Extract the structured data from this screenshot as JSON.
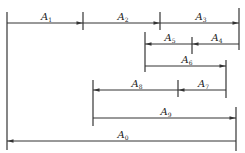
{
  "diagram": {
    "type": "dimension-chain",
    "colors": {
      "line": "#333333",
      "background": "#ffffff",
      "text": "#222222"
    },
    "verticals": [
      {
        "id": "left-datum",
        "x": 7,
        "y1": 12,
        "y2": 150
      },
      {
        "id": "tick-1-2",
        "x": 83,
        "y1": 12,
        "y2": 30
      },
      {
        "id": "tick-2-3",
        "x": 160,
        "y1": 12,
        "y2": 30
      },
      {
        "id": "right-A3",
        "x": 239,
        "y1": 8,
        "y2": 50
      },
      {
        "id": "left-A5",
        "x": 145,
        "y1": 32,
        "y2": 72
      },
      {
        "id": "tick-5-4",
        "x": 192,
        "y1": 37,
        "y2": 54
      },
      {
        "id": "right-A6",
        "x": 226,
        "y1": 60,
        "y2": 98
      },
      {
        "id": "left-A8",
        "x": 93,
        "y1": 80,
        "y2": 126
      },
      {
        "id": "tick-8-7",
        "x": 178,
        "y1": 80,
        "y2": 97
      },
      {
        "id": "right-A9",
        "x": 236,
        "y1": 107,
        "y2": 151
      }
    ],
    "dimensions": [
      {
        "label": "A",
        "sub": "1",
        "from": 7,
        "to": 83,
        "y": 23,
        "arrow": "right"
      },
      {
        "label": "A",
        "sub": "2",
        "from": 83,
        "to": 160,
        "y": 23,
        "arrow": "right"
      },
      {
        "label": "A",
        "sub": "3",
        "from": 160,
        "to": 239,
        "y": 23,
        "arrow": "right"
      },
      {
        "label": "A",
        "sub": "5",
        "from": 145,
        "to": 192,
        "y": 44,
        "arrow": "left"
      },
      {
        "label": "A",
        "sub": "4",
        "from": 192,
        "to": 239,
        "y": 44,
        "arrow": "left"
      },
      {
        "label": "A",
        "sub": "6",
        "from": 145,
        "to": 226,
        "y": 66,
        "arrow": "right"
      },
      {
        "label": "A",
        "sub": "8",
        "from": 93,
        "to": 178,
        "y": 90,
        "arrow": "left"
      },
      {
        "label": "A",
        "sub": "7",
        "from": 178,
        "to": 226,
        "y": 90,
        "arrow": "left"
      },
      {
        "label": "A",
        "sub": "9",
        "from": 93,
        "to": 236,
        "y": 118,
        "arrow": "right"
      },
      {
        "label": "A",
        "sub": "0",
        "from": 7,
        "to": 236,
        "y": 141,
        "arrow": "left"
      }
    ]
  }
}
